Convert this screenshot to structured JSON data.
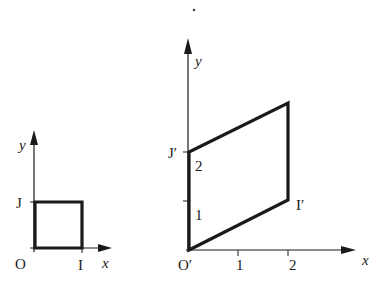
{
  "figure_left": {
    "title": "Unit square",
    "axis_x_label": "x",
    "axis_y_label": "y",
    "origin_label": "O",
    "point_i_label": "I",
    "point_j_label": "J"
  },
  "figure_right": {
    "title": "Transformed parallelogram",
    "axis_x_label": "x",
    "axis_y_label": "y",
    "origin_label": "O′",
    "point_i_label": "I′",
    "point_j_label": "J′",
    "x_ticks": [
      "1",
      "2"
    ],
    "y_ticks": [
      "1",
      "2"
    ]
  },
  "colors": {
    "ink": "#1a1a1a",
    "background": "#ffffff"
  }
}
